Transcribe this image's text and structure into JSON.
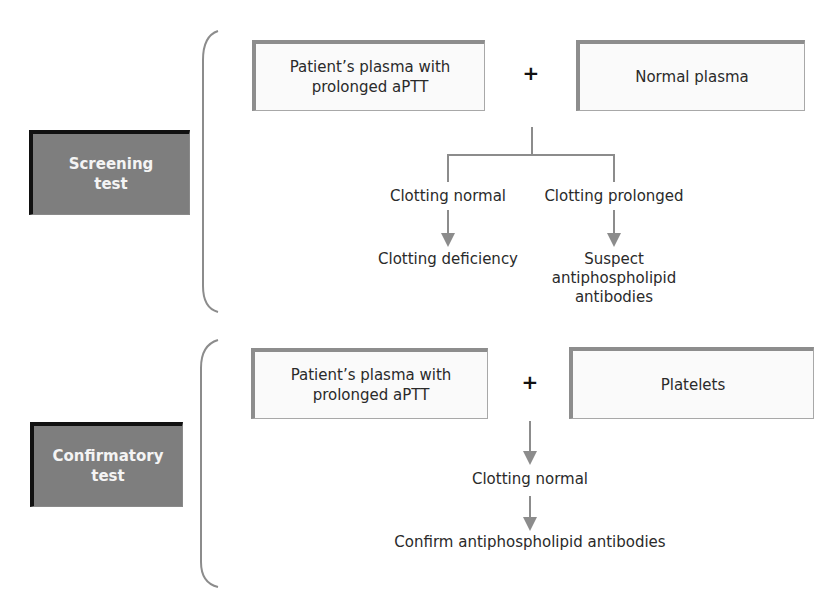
{
  "screening": {
    "label": "Screening\ntest",
    "left_box": "Patient’s plasma with\nprolonged aPTT",
    "operator": "+",
    "right_box": "Normal plasma",
    "branches": [
      {
        "result": "Clotting normal",
        "conclusion": "Clotting deficiency"
      },
      {
        "result": "Clotting prolonged",
        "conclusion": "Suspect\nantiphospholipid\nantibodies"
      }
    ]
  },
  "confirmatory": {
    "label": "Confirmatory\ntest",
    "left_box": "Patient’s plasma with\nprolonged aPTT",
    "operator": "+",
    "right_box": "Platelets",
    "result": "Clotting normal",
    "conclusion": "Confirm antiphospholipid antibodies"
  },
  "colors": {
    "label_fill": "#7e7e7e",
    "label_border": "#111111",
    "box_border": "#8d8d8d",
    "connector": "#8c8c8c"
  }
}
